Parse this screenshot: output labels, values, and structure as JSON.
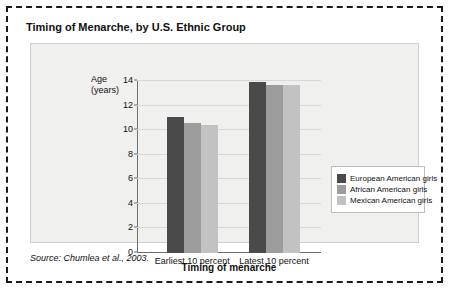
{
  "title": "Timing of Menarche, by U.S. Ethnic Group",
  "source": "Source: Chumlea et al., 2003.",
  "y_label_lines": [
    "Age",
    "(years)"
  ],
  "legend": {
    "items": [
      {
        "label": "European American girls",
        "color": "#4a4a4a"
      },
      {
        "label": "African American girls",
        "color": "#9d9d9d"
      },
      {
        "label": "Mexican American girls",
        "color": "#c2c2c2"
      }
    ]
  },
  "chart_data": {
    "type": "bar",
    "title": "Timing of Menarche, by U.S. Ethnic Group",
    "xlabel": "Timing of menarche",
    "ylabel": "Age (years)",
    "ylim": [
      0,
      14
    ],
    "yticks": [
      0,
      2,
      4,
      6,
      8,
      10,
      12,
      14
    ],
    "grid": true,
    "legend_position": "right",
    "categories": [
      "Earliest 10 percent",
      "Latest 10 percent"
    ],
    "series": [
      {
        "name": "European American girls",
        "color": "#4a4a4a",
        "values": [
          11.1,
          13.9
        ]
      },
      {
        "name": "African American girls",
        "color": "#9d9d9d",
        "values": [
          10.6,
          13.7
        ]
      },
      {
        "name": "Mexican American girls",
        "color": "#c2c2c2",
        "values": [
          10.4,
          13.7
        ]
      }
    ],
    "annotation": "Source: Chumlea et al., 2003."
  }
}
